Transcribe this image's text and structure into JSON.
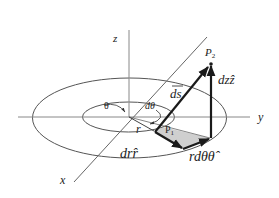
{
  "diagram": {
    "axes": {
      "x_label": "x",
      "y_label": "y",
      "z_label": "z"
    },
    "angle_labels": {
      "theta": "θ",
      "d_theta": "dθ"
    },
    "points": {
      "p1": "P",
      "p1_sub": "1",
      "p2": "P",
      "p2_sub": "2"
    },
    "vectors": {
      "r": "r",
      "ds": "ds",
      "dz_hat_z": "dzẑ",
      "dr_hat_r": "drr̂",
      "r_dtheta_hat_theta": "rdθθ̂"
    },
    "colors": {
      "line": "#555555",
      "arrow": "#1a1a1a",
      "shade": "#cccccc",
      "text": "#222222"
    }
  }
}
